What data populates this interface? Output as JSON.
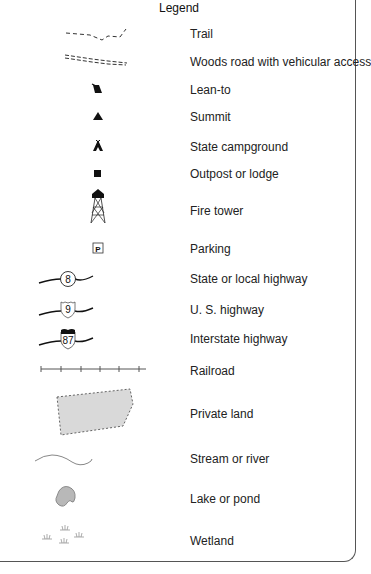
{
  "legend": {
    "title": "Legend",
    "items": [
      {
        "icon": "trail-dashed-line-icon",
        "label": "Trail"
      },
      {
        "icon": "woods-road-double-dashed-line-icon",
        "label": "Woods road with vehicular access"
      },
      {
        "icon": "lean-to-icon",
        "label": "Lean-to"
      },
      {
        "icon": "summit-triangle-icon",
        "label": "Summit"
      },
      {
        "icon": "campground-tent-icon",
        "label": "State campground"
      },
      {
        "icon": "lodge-square-icon",
        "label": "Outpost or lodge"
      },
      {
        "icon": "fire-tower-icon",
        "label": "Fire tower"
      },
      {
        "icon": "parking-p-icon",
        "label": "Parking"
      },
      {
        "icon": "state-highway-circle-shield-icon",
        "label": "State or local highway",
        "route_number": "8"
      },
      {
        "icon": "us-highway-shield-icon",
        "label": "U. S. highway",
        "route_number": "9"
      },
      {
        "icon": "interstate-shield-icon",
        "label": "Interstate highway",
        "route_number": "87"
      },
      {
        "icon": "railroad-tick-line-icon",
        "label": "Railroad"
      },
      {
        "icon": "private-land-polygon-icon",
        "label": "Private land"
      },
      {
        "icon": "stream-wavy-line-icon",
        "label": "Stream or river"
      },
      {
        "icon": "lake-blob-icon",
        "label": "Lake or pond"
      },
      {
        "icon": "wetland-marsh-icon",
        "label": "Wetland"
      }
    ]
  },
  "colors": {
    "ink": "#1a1a1a",
    "private_land_fill": "#d9d9d9",
    "lake_fill": "#b8b8b8",
    "stream": "#888888",
    "frame": "#555555"
  }
}
